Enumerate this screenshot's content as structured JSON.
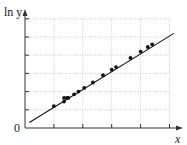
{
  "chart_data": {
    "type": "scatter",
    "title": "",
    "xlabel": "x",
    "ylabel": "ln y",
    "origin_label": "0",
    "xlim": [
      0,
      5.5
    ],
    "ylim": [
      0,
      6.5
    ],
    "grid": true,
    "x_ticks": [
      1,
      2,
      3,
      4,
      5
    ],
    "y_ticks": [
      1,
      2,
      3,
      4,
      5,
      6
    ],
    "tick_labels_shown": false,
    "points": [
      {
        "x": 1.0,
        "y": 1.2
      },
      {
        "x": 1.35,
        "y": 1.45
      },
      {
        "x": 1.35,
        "y": 1.65
      },
      {
        "x": 1.45,
        "y": 1.65
      },
      {
        "x": 1.5,
        "y": 1.65
      },
      {
        "x": 1.7,
        "y": 1.85
      },
      {
        "x": 1.85,
        "y": 2.0
      },
      {
        "x": 2.05,
        "y": 2.2
      },
      {
        "x": 2.35,
        "y": 2.5
      },
      {
        "x": 2.7,
        "y": 2.9
      },
      {
        "x": 3.0,
        "y": 3.2
      },
      {
        "x": 3.15,
        "y": 3.35
      },
      {
        "x": 3.65,
        "y": 3.85
      },
      {
        "x": 4.0,
        "y": 4.2
      },
      {
        "x": 4.25,
        "y": 4.45
      },
      {
        "x": 4.4,
        "y": 4.6
      }
    ],
    "fit_line": {
      "x0": 0.15,
      "y0": 0.3,
      "x1": 5.15,
      "y1": 5.2
    },
    "legend": null
  },
  "colors": {
    "axis": "#333333",
    "grid": "#bbbbbb",
    "points": "#111111",
    "line": "#111111"
  }
}
